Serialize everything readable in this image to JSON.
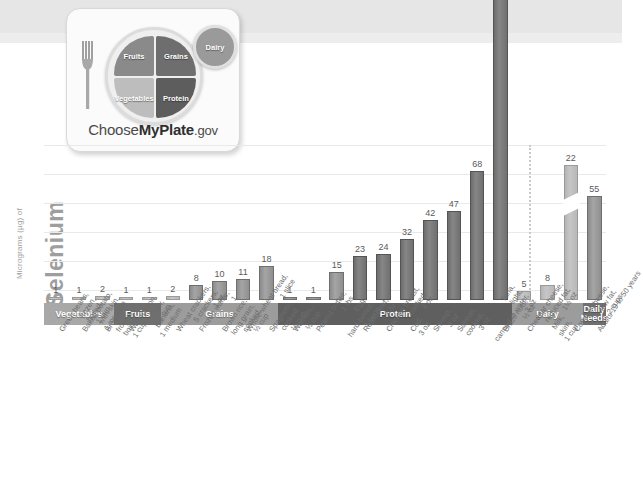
{
  "logo": {
    "fruits": "Fruits",
    "grains": "Grains",
    "vegetables": "Vegetables",
    "protein": "Protein",
    "dairy": "Dairy",
    "wordmark_pre": "Choose",
    "wordmark_bold": "MyPlate",
    "wordmark_post": ".gov"
  },
  "axis": {
    "title_main": "Selenium",
    "title_units": "Micrograms (µg) of",
    "gridlines": 6
  },
  "colors": {
    "bar": "#8f8f8f",
    "bar_dark": "#6d6d6d",
    "bar_light": "#b8b8b8",
    "band_vegetables": "#a8a8a8",
    "band_fruits": "#6f6f6f",
    "band_grains": "#9c9c9c",
    "band_protein": "#5f5f5f",
    "band_dairy": "#9c9c9c",
    "band_daily": "#6f6f6f",
    "grid": "#e9e9e9"
  },
  "chart_data": {
    "type": "bar",
    "title": "Selenium",
    "xlabel": "",
    "ylabel": "Micrograms (µg) of Selenium",
    "ylim": [
      0,
      75
    ],
    "grid": true,
    "axis_break": {
      "bar_index": 22,
      "value": 544,
      "note": "bar broken to fit scale"
    },
    "categories": [
      "Green beans, frozen, boiled, 1 cup",
      "Baked potato, with skin, 1 medium",
      "Broccoli, frozen, boiled, 1 cup",
      "Watermelon, raw, 1 cup",
      "Banana, 1 medium",
      "Wheat crackers, 5 crackers, 1 oz",
      "Frozen waffle, 1",
      "Brown rice, long grain, cooked, ½ cup",
      "Whole-wheat bread, 1 slice",
      "Spaghetti, cooked, ½ cup",
      "Walnuts, ½ cup",
      "Peanut butter, 1 tbs",
      "Egg, hard-boiled, 1 large",
      "Roast beef, 3 oz",
      "Chicken breast, cooked, 3 oz",
      "Cod, 3 oz",
      "Shrimp, 3 oz",
      "Salmon, cooked, 3 oz",
      "Tuna, light, canned in water, 3 oz",
      "Brazil nuts, ½ oz",
      "Cheddar cheese, reduced fat, 1½ oz",
      "Milk, skim, 1 cup",
      "Cottage cheese, low fat, 2 cups",
      "Adults 19 to 50 years"
    ],
    "values": [
      1,
      1,
      2,
      1,
      1,
      2,
      8,
      10,
      11,
      18,
      1,
      1,
      15,
      23,
      24,
      32,
      42,
      47,
      68,
      544,
      5,
      8,
      22,
      55
    ],
    "groups": [
      {
        "label": "Vegetables",
        "start": 0,
        "count": 3
      },
      {
        "label": "Fruits",
        "start": 3,
        "count": 2
      },
      {
        "label": "Grains",
        "start": 5,
        "count": 5
      },
      {
        "label": "Protein",
        "start": 10,
        "count": 10
      },
      {
        "label": "Dairy",
        "start": 20,
        "count": 3
      },
      {
        "label": "Daily",
        "label2": "Needs",
        "start": 23,
        "count": 1
      }
    ]
  }
}
